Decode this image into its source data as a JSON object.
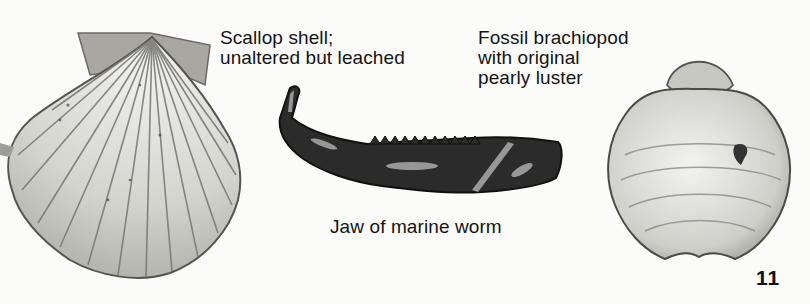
{
  "figures": [
    {
      "id": "scallop",
      "label_lines": [
        "Scallop shell;",
        "unaltered but leached"
      ]
    },
    {
      "id": "brachiopod",
      "label_lines": [
        "Fossil brachiopod",
        "with original",
        "pearly luster"
      ]
    },
    {
      "id": "jaw",
      "label_lines": [
        "Jaw of marine worm"
      ]
    }
  ],
  "page_number": "11",
  "colors": {
    "background": "#fbfbfa",
    "ink": "#141414",
    "shell_light": "#e6e6e2",
    "shell_mid": "#9a9a96",
    "jaw_dark": "#2a2a2a"
  }
}
